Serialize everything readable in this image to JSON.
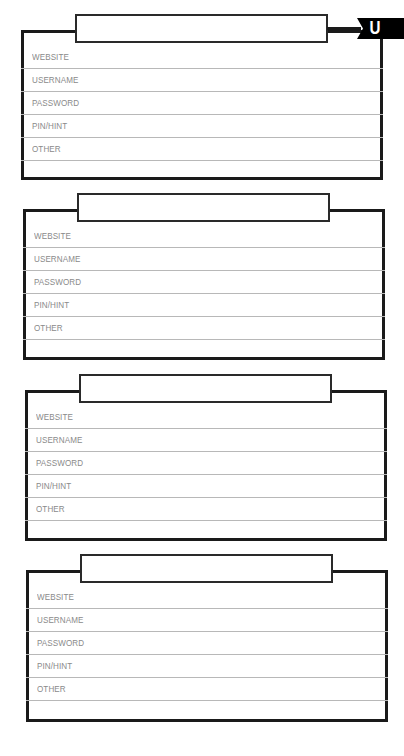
{
  "index_tab": {
    "letter": "U",
    "background_color": "#000000",
    "text_color": "#ffffff"
  },
  "field_labels": [
    "WEBSITE",
    "USERNAME",
    "PASSWORD",
    "PIN/HINT",
    "OTHER"
  ],
  "cards": [
    {
      "title": "",
      "fields": [
        {
          "label": "WEBSITE",
          "value": ""
        },
        {
          "label": "USERNAME",
          "value": ""
        },
        {
          "label": "PASSWORD",
          "value": ""
        },
        {
          "label": "PIN/HINT",
          "value": ""
        },
        {
          "label": "OTHER",
          "value": ""
        }
      ]
    },
    {
      "title": "",
      "fields": [
        {
          "label": "WEBSITE",
          "value": ""
        },
        {
          "label": "USERNAME",
          "value": ""
        },
        {
          "label": "PASSWORD",
          "value": ""
        },
        {
          "label": "PIN/HINT",
          "value": ""
        },
        {
          "label": "OTHER",
          "value": ""
        }
      ]
    },
    {
      "title": "",
      "fields": [
        {
          "label": "WEBSITE",
          "value": ""
        },
        {
          "label": "USERNAME",
          "value": ""
        },
        {
          "label": "PASSWORD",
          "value": ""
        },
        {
          "label": "PIN/HINT",
          "value": ""
        },
        {
          "label": "OTHER",
          "value": ""
        }
      ]
    },
    {
      "title": "",
      "fields": [
        {
          "label": "WEBSITE",
          "value": ""
        },
        {
          "label": "USERNAME",
          "value": ""
        },
        {
          "label": "PASSWORD",
          "value": ""
        },
        {
          "label": "PIN/HINT",
          "value": ""
        },
        {
          "label": "OTHER",
          "value": ""
        }
      ]
    }
  ]
}
